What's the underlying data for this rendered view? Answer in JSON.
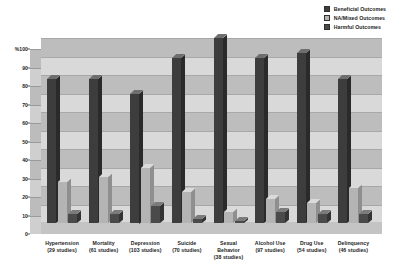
{
  "chart_data": {
    "type": "bar",
    "title": "",
    "subtitle": "",
    "xlabel": "",
    "ylabel": "%",
    "ylim": [
      0,
      100
    ],
    "grid": true,
    "legend_position": "top-right",
    "y_ticks": [
      "%100",
      "90",
      "80",
      "70",
      "60",
      "50",
      "40",
      "30",
      "20",
      "10",
      "0"
    ],
    "y_tick_values": [
      100,
      90,
      80,
      70,
      60,
      50,
      40,
      30,
      20,
      10,
      0
    ],
    "categories": [
      "Hypertension",
      "Mortality",
      "Depression",
      "Suicide",
      "Sexual Behavior",
      "Alcohol Use",
      "Drug Use",
      "Delinquency"
    ],
    "category_sublabels": [
      "(29 studies)",
      "(61 studies)",
      "(103 studies)",
      "(70 studies)",
      "(38 studies)",
      "(97 studies)",
      "(54 studies)",
      "(46 studies)"
    ],
    "study_counts": [
      29,
      61,
      103,
      70,
      38,
      97,
      54,
      46
    ],
    "series": [
      {
        "name": "Beneficial Outcomes",
        "color": "#3d3d3d",
        "values": [
          78,
          78,
          70,
          89,
          100,
          89,
          92,
          78
        ]
      },
      {
        "name": "NA/Mixed Outcomes",
        "color": "#b4b4b4",
        "values": [
          22,
          25,
          30,
          17,
          6,
          13,
          11,
          19
        ]
      },
      {
        "name": "Harmful Outcomes",
        "color": "#4a4a4a",
        "values": [
          5,
          5,
          9,
          2,
          1,
          6,
          5,
          5
        ]
      }
    ]
  },
  "legend": {
    "items": [
      {
        "label": "Beneficial Outcomes",
        "color": "#3d3d3d"
      },
      {
        "label": "NA/Mixed Outcomes",
        "color": "#b4b4b4"
      },
      {
        "label": "Harmful Outcomes",
        "color": "#4a4a4a"
      }
    ]
  },
  "axis": {
    "y_label_top": "%100"
  }
}
